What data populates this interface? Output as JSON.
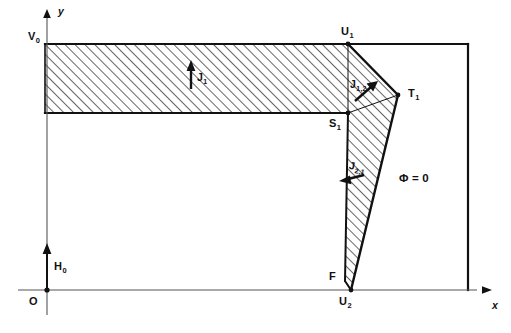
{
  "figure": {
    "background_color": "#ffffff",
    "line_color": "#111111",
    "hatch_color": "#333333",
    "width": 511,
    "height": 333
  },
  "axes": {
    "x_label": "x",
    "y_label": "y",
    "origin_label": "O",
    "x_axis_y": 290,
    "y_axis_x": 47,
    "x_axis_arrow_tip_x": 489,
    "y_axis_arrow_tip_y": 10
  },
  "points": [
    {
      "id": "V0",
      "label": "V",
      "sub": "0",
      "x": 45,
      "y": 44,
      "label_x": 28,
      "label_y": 31
    },
    {
      "id": "U1",
      "label": "U",
      "sub": "1",
      "x": 348,
      "y": 44,
      "label_x": 340,
      "label_y": 27
    },
    {
      "id": "T1",
      "label": "T",
      "sub": "1",
      "x": 398,
      "y": 95,
      "label_x": 407,
      "label_y": 88
    },
    {
      "id": "S1",
      "label": "S",
      "sub": "1",
      "x": 348,
      "y": 113,
      "label_x": 330,
      "label_y": 118
    },
    {
      "id": "F",
      "label": "F",
      "sub": "",
      "x": 345,
      "y": 281,
      "label_x": 330,
      "label_y": 272
    },
    {
      "id": "U2",
      "label": "U",
      "sub": "2",
      "x": 351,
      "y": 290,
      "label_x": 340,
      "label_y": 296
    },
    {
      "id": "H0",
      "label": "H",
      "sub": "0",
      "x": 47,
      "y": 250,
      "label_x": 54,
      "label_y": 262
    }
  ],
  "labels": {
    "potential": "Φ = 0",
    "potential_x": 400,
    "potential_y": 178,
    "flux_j1": {
      "text": "J",
      "sub": "1",
      "x": 197,
      "y": 76
    },
    "flux_j12": {
      "text": "J",
      "sub": "1,2",
      "x": 353,
      "y": 84
    },
    "flux_j21": {
      "text": "J",
      "sub": "2,1",
      "x": 351,
      "y": 164
    }
  },
  "regions": {
    "band_top_y": 44,
    "band_bottom_y": 113,
    "band_left_x": 45,
    "band_right_x": 348,
    "outer_right_x": 468,
    "outer_top_y": 44
  },
  "arrows": {
    "j1": {
      "x": 191,
      "y1": 88,
      "y2": 64,
      "direction": "up"
    },
    "j12": {
      "x1": 348,
      "y1": 100,
      "x2": 374,
      "y2": 83,
      "direction": "up-right"
    },
    "j21": {
      "x1": 362,
      "y1": 174,
      "x2": 341,
      "y2": 180,
      "direction": "left-down"
    },
    "h0": {
      "x": 47,
      "y1": 290,
      "y2": 245,
      "direction": "up"
    }
  }
}
